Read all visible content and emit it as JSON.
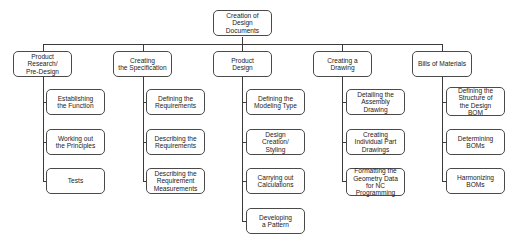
{
  "root": {
    "label": "Creation of\nDesign\nDocuments"
  },
  "columns": [
    {
      "label": "Product\nResearch/\nPre-Design",
      "children": [
        "Establishing\nthe Function",
        "Working out\nthe Principles",
        "Tests"
      ]
    },
    {
      "label": "Creating\nthe Specification",
      "children": [
        "Defining the\nRequirements",
        "Describing the\nRequirements",
        "Describing the\nRequirement\nMeasurements"
      ]
    },
    {
      "label": "Product\nDesign",
      "children": [
        "Defining the\nModeling Type",
        "Design\nCreation/\nStyling",
        "Carrying out\nCalculations",
        "Developing\na Pattern"
      ]
    },
    {
      "label": "Creating a\nDrawing",
      "children": [
        "Detailing the\nAssembly\nDrawing",
        "Creating\nIndividual Part\nDrawings",
        "Formatting the\nGeometry Data\nfor NC\nProgramming"
      ]
    },
    {
      "label": "Bills of Materials",
      "children": [
        "Defining the\nStructure of\nthe Design\nBOM",
        "Determining\nBOMs",
        "Harmonizing\nBOMs"
      ]
    }
  ],
  "colors": {
    "line": "#3a3a3a",
    "border": "#4a4a4a",
    "text": "#222222",
    "background": "#ffffff"
  }
}
